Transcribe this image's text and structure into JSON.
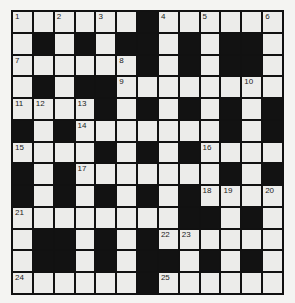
{
  "puzzle": {
    "rows": 13,
    "cols": 13,
    "grid": [
      ".......#......",
      "x"
    ],
    "layout": [
      "......#......",
      ".#.#.##.#.##.",
      "......#.#.##.",
      ".#.##........",
      "....#.#.#.#.#",
      "#.#.......#.#",
      "....#.#.#....",
      "#.#.......#.#",
      "#.#.#.#.#....",
      "........##.#.",
      ".##.#.#......",
      ".##.#.##.#.#.",
      "......#......"
    ],
    "numbers": [
      {
        "r": 0,
        "c": 0,
        "n": "1"
      },
      {
        "r": 0,
        "c": 2,
        "n": "2"
      },
      {
        "r": 0,
        "c": 4,
        "n": "3"
      },
      {
        "r": 0,
        "c": 7,
        "n": "4"
      },
      {
        "r": 0,
        "c": 9,
        "n": "5"
      },
      {
        "r": 0,
        "c": 12,
        "n": "6"
      },
      {
        "r": 2,
        "c": 0,
        "n": "7"
      },
      {
        "r": 2,
        "c": 5,
        "n": "8"
      },
      {
        "r": 3,
        "c": 5,
        "n": "9"
      },
      {
        "r": 3,
        "c": 11,
        "n": "10"
      },
      {
        "r": 4,
        "c": 0,
        "n": "11"
      },
      {
        "r": 4,
        "c": 1,
        "n": "12"
      },
      {
        "r": 4,
        "c": 3,
        "n": "13"
      },
      {
        "r": 5,
        "c": 3,
        "n": "14"
      },
      {
        "r": 6,
        "c": 0,
        "n": "15"
      },
      {
        "r": 6,
        "c": 9,
        "n": "16"
      },
      {
        "r": 7,
        "c": 3,
        "n": "17"
      },
      {
        "r": 8,
        "c": 9,
        "n": "18"
      },
      {
        "r": 8,
        "c": 10,
        "n": "19"
      },
      {
        "r": 8,
        "c": 12,
        "n": "20"
      },
      {
        "r": 9,
        "c": 0,
        "n": "21"
      },
      {
        "r": 10,
        "c": 7,
        "n": "22"
      },
      {
        "r": 10,
        "c": 8,
        "n": "23"
      },
      {
        "r": 12,
        "c": 0,
        "n": "24"
      },
      {
        "r": 12,
        "c": 7,
        "n": "25"
      }
    ]
  }
}
